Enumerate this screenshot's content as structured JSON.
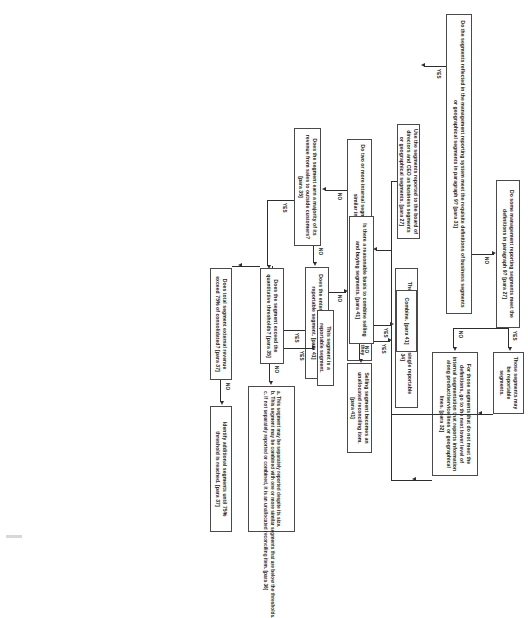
{
  "diagram": {
    "nodes": {
      "n1": "Do the segments reflected in the management reporting system meet the requisite definitions of business segments or geographical segments in paragraph 9? [para 31]",
      "n2": "Use the segments reported to the board of directors and CEO as business segments or geographical segments. [para 27]",
      "n3": "Do some management reporting segments meet the definitions in paragraph 9? [para 27]",
      "n4": "Those segments may be reportable segments.",
      "n5": "For those segments that do not meet the definitions, go to the next lower level of internal segmentation that reports information along product/service lines or geographical lines. [para 32]",
      "n6": "Do two or more internal segments exhibit similar long-term performance and are they similar in all factors in paragraph 9? [para 34]",
      "n7": "They may be combined as a single reportable segment. [para 34]",
      "n8": "Does the segment earn a majority of its revenue from sales to outside customers? [para 35]",
      "n9": "Does the enterprise elect to treat it as a reportable segment. [para 41]",
      "n10": "Is there a reasonable basis to combine selling and buying segments. [para 41]",
      "n11": "Combine. [para 41]",
      "n12": "Selling segment becomes an unallocated reconciling item. [para 41]",
      "n13": "Does the segment exceed the quantitative thresholds? [para 35]",
      "n14": "This segment is a reportable segment.",
      "n15": "Does total segment external revenue exceed 75% of consolidated? [para 37]",
      "n16": "Identify additional segments until 75% threshold is reached. [para 37]"
    },
    "notes": {
      "a": "a. This segment may be separately reported despite its size.",
      "b": "b. This segment may be combined with one or more similar segments that are below the thresholds.",
      "c": "c. If not separately reported or combined, it is an unallocated reconciling item. [para 36]"
    },
    "edge_labels": {
      "yes": "YES",
      "no": "NO"
    },
    "colors": {
      "box_border": "#4a4a4a",
      "line": "#2e2e2e",
      "text": "#1a1a1a",
      "background": "#ffffff"
    }
  }
}
